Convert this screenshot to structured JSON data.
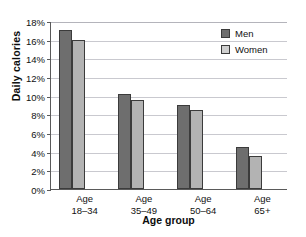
{
  "artifact_text": "",
  "chart_data": {
    "type": "bar",
    "title": "",
    "xlabel": "Age group",
    "ylabel": "Daily calories",
    "categories": [
      "Age 18–34",
      "Age 35–49",
      "Age 50–64",
      "Age 65+"
    ],
    "category_lines": [
      {
        "line1": "Age",
        "line2": "18–34"
      },
      {
        "line1": "Age",
        "line2": "35–49"
      },
      {
        "line1": "Age",
        "line2": "50–64"
      },
      {
        "line1": "Age",
        "line2": "65+"
      }
    ],
    "series": [
      {
        "name": "Men",
        "color": "#6e6e6e",
        "values": [
          17.0,
          10.2,
          9.0,
          4.5
        ]
      },
      {
        "name": "Women",
        "color": "#b3b3b3",
        "values": [
          16.0,
          9.5,
          8.5,
          3.5
        ]
      }
    ],
    "ylim": [
      0,
      18
    ],
    "ytick_step": 2,
    "ytick_labels": [
      "0%",
      "2%",
      "4%",
      "6%",
      "8%",
      "10%",
      "12%",
      "14%",
      "16%",
      "18%"
    ],
    "yunit": "%",
    "grid": true,
    "legend_position": "top-right",
    "legend": [
      "Men",
      "Women"
    ]
  }
}
